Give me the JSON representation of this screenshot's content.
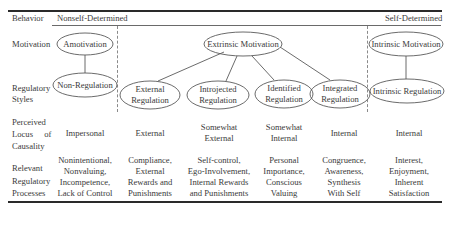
{
  "header": {
    "behavior_label": "Behavior",
    "nonself_determined": "Nonself-Determined",
    "self_determined": "Self-Determined"
  },
  "row_labels": {
    "motivation": "Motivation",
    "regulatory_styles": [
      "Regulatory",
      "Styles"
    ],
    "perceived_locus": [
      "Perceived",
      "Locus of",
      "Causality"
    ],
    "relevant_processes": [
      "Relevant",
      "Regulatory",
      "Processes"
    ]
  },
  "nodes": {
    "amotivation": "Amotivation",
    "non_regulation": "Non-Regulation",
    "extrinsic_motivation": "Extrinsic Motivation",
    "external_regulation": [
      "External",
      "Regulation"
    ],
    "introjected_regulation": [
      "Introjected",
      "Regulation"
    ],
    "identified_regulation": [
      "Identified",
      "Regulation"
    ],
    "integrated_regulation": [
      "Integrated",
      "Regulation"
    ],
    "intrinsic_motivation": "Intrinsic Motivation",
    "intrinsic_regulation": "Intrinsic Regulation"
  },
  "locus": [
    [
      "Impersonal"
    ],
    [
      "External"
    ],
    [
      "Somewhat",
      "External"
    ],
    [
      "Somewhat",
      "Internal"
    ],
    [
      "Internal"
    ],
    [
      "Internal"
    ]
  ],
  "processes": [
    [
      "Nonintentional,",
      "Nonvaluing,",
      "Incompetence,",
      "Lack of Control"
    ],
    [
      "Compliance,",
      "External",
      "Rewards and",
      "Punishments"
    ],
    [
      "Self-control,",
      "Ego-Involvement,",
      "Internal Rewards",
      "and Punishments"
    ],
    [
      "Personal",
      "Importance,",
      "Conscious",
      "Valuing"
    ],
    [
      "Congruence,",
      "Awareness,",
      "Synthesis",
      "With Self"
    ],
    [
      "Interest,",
      "Enjoyment,",
      "Inherent",
      "Satisfaction"
    ]
  ],
  "colors": {
    "text": "#3a3a3a",
    "rule": "#2a2a2a",
    "line": "#6a6a6a"
  }
}
